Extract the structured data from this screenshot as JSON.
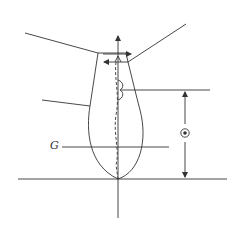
{
  "figure": {
    "type": "physics-diagram",
    "labels": {
      "g": "G"
    },
    "symbols": {
      "center_marker": "circled-dot",
      "dimension": "double-headed vertical arrow"
    },
    "colors": {
      "stroke": "#333333",
      "background": "#ffffff"
    }
  }
}
